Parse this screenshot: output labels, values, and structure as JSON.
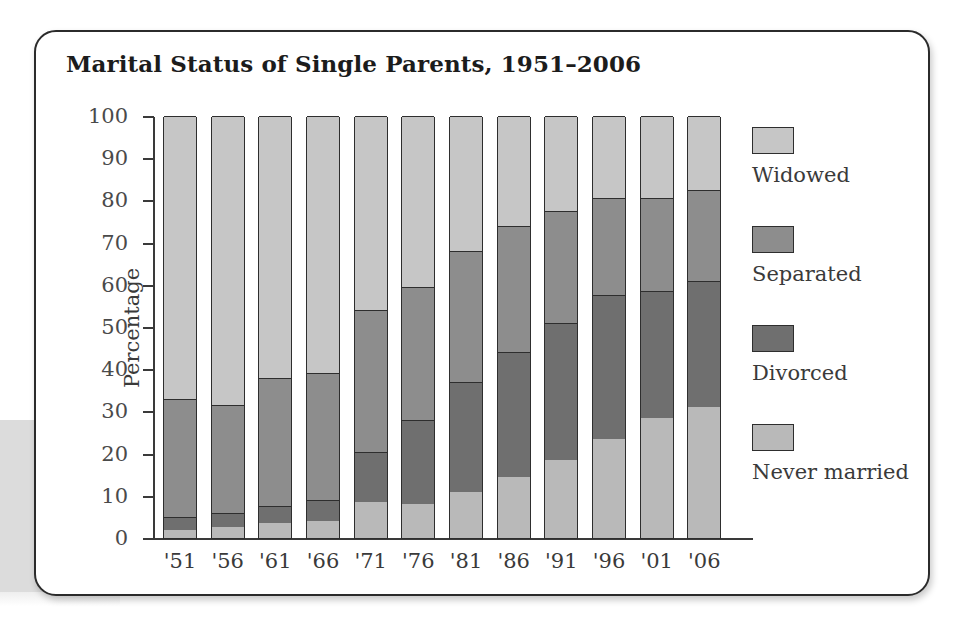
{
  "chart_data": {
    "type": "bar",
    "subtype": "stacked-percentage",
    "title": "Marital Status of Single Parents, 1951–2006",
    "xlabel": "",
    "ylabel": "Percentage",
    "ylim": [
      0,
      100
    ],
    "ytick_step": 10,
    "yticks": [
      0,
      10,
      20,
      30,
      40,
      50,
      60,
      70,
      80,
      90,
      100
    ],
    "ytick_labels": [
      "0",
      "10",
      "20",
      "30",
      "40",
      "50",
      "60",
      "70",
      "80",
      "90",
      "100"
    ],
    "grid": false,
    "legend_position": "right",
    "categories": [
      "'51",
      "'56",
      "'61",
      "'66",
      "'71",
      "'76",
      "'81",
      "'86",
      "'91",
      "'96",
      "'01",
      "'06"
    ],
    "series": [
      {
        "name": "Never married",
        "color": "#b9b9b9",
        "values": [
          2,
          2.5,
          3.5,
          4,
          8.5,
          8,
          11,
          14.5,
          18.5,
          23.5,
          28.5,
          31
        ]
      },
      {
        "name": "Divorced",
        "color": "#6f6f6f",
        "values": [
          3,
          3.5,
          4,
          5,
          12,
          20,
          26,
          29.5,
          32.5,
          34,
          30,
          30
        ]
      },
      {
        "name": "Separated",
        "color": "#8d8d8d",
        "values": [
          28,
          25.5,
          30.5,
          30,
          33.5,
          31.5,
          31,
          30,
          26.5,
          23,
          22,
          21.5
        ]
      },
      {
        "name": "Widowed",
        "color": "#c6c6c6",
        "values": [
          67,
          68.5,
          62,
          61,
          46,
          40.5,
          32,
          26,
          22.5,
          19.5,
          19.5,
          17.5
        ]
      }
    ],
    "cumulative_tops": {
      "never_married": [
        2,
        2.5,
        3.5,
        4,
        8.5,
        8,
        11,
        14.5,
        18.5,
        23.5,
        28.5,
        31
      ],
      "divorced": [
        5,
        6,
        7.5,
        9,
        20.5,
        28,
        37,
        44,
        51,
        57.5,
        58.5,
        61
      ],
      "separated": [
        33,
        31.5,
        38,
        39,
        54,
        59.5,
        68,
        74,
        77.5,
        80.5,
        80.5,
        82.5
      ],
      "widowed": [
        100,
        100,
        100,
        100,
        100,
        100,
        100,
        100,
        100,
        100,
        100,
        100
      ]
    },
    "annotations": []
  },
  "legend": {
    "items": [
      {
        "label": "Widowed",
        "color": "#c6c6c6"
      },
      {
        "label": "Separated",
        "color": "#8d8d8d"
      },
      {
        "label": "Divorced",
        "color": "#6f6f6f"
      },
      {
        "label": "Never married",
        "color": "#b9b9b9"
      }
    ]
  }
}
